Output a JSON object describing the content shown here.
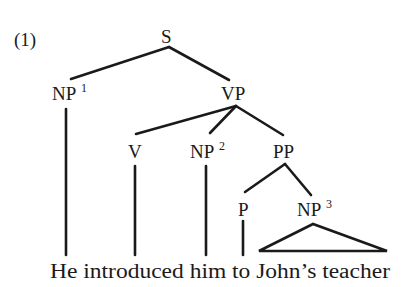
{
  "example": {
    "number_label": "(1)"
  },
  "nodes": {
    "S": {
      "label": "S",
      "sup": ""
    },
    "NP1": {
      "label": "NP",
      "sup": "1"
    },
    "VP": {
      "label": "VP",
      "sup": ""
    },
    "V": {
      "label": "V",
      "sup": ""
    },
    "NP2": {
      "label": "NP",
      "sup": "2"
    },
    "PP": {
      "label": "PP",
      "sup": ""
    },
    "P": {
      "label": "P",
      "sup": ""
    },
    "NP3": {
      "label": "NP",
      "sup": "3"
    }
  },
  "sentence": {
    "text": "He introduced him to John’s teacher",
    "words": [
      "He",
      "introduced",
      "him",
      "to",
      "John’s",
      "teacher"
    ]
  },
  "structure": {
    "S": [
      "NP1",
      "VP"
    ],
    "VP": [
      "V",
      "NP2",
      "PP"
    ],
    "PP": [
      "P",
      "NP3"
    ],
    "NP3": "triangle"
  },
  "colors": {
    "ink": "#1a1a1a",
    "background": "#ffffff"
  }
}
